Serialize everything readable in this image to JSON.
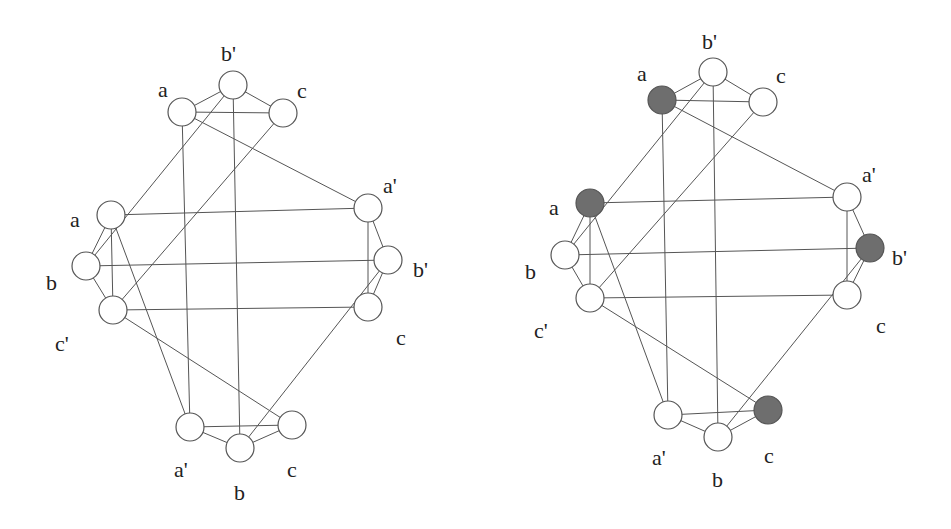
{
  "colors": {
    "background": "#ffffff",
    "edge": "#555555",
    "node_outline": "#555555",
    "node_empty": "#ffffff",
    "node_filled": "#6e6e6e",
    "label": "#222222"
  },
  "node_radius": 14,
  "graphs": [
    {
      "id": "left-graph",
      "nodes": [
        {
          "id": "T_a",
          "label": "a",
          "x": 182,
          "y": 112,
          "filled": false,
          "lx": 158,
          "ly": 92
        },
        {
          "id": "T_b",
          "label": "b'",
          "x": 233,
          "y": 85,
          "filled": false,
          "lx": 221,
          "ly": 56
        },
        {
          "id": "T_c",
          "label": "c",
          "x": 283,
          "y": 113,
          "filled": false,
          "lx": 297,
          "ly": 93
        },
        {
          "id": "L_a",
          "label": "a",
          "x": 111,
          "y": 215,
          "filled": false,
          "lx": 70,
          "ly": 222
        },
        {
          "id": "L_b",
          "label": "b",
          "x": 86,
          "y": 266,
          "filled": false,
          "lx": 46,
          "ly": 285
        },
        {
          "id": "L_c",
          "label": "c'",
          "x": 113,
          "y": 310,
          "filled": false,
          "lx": 55,
          "ly": 346
        },
        {
          "id": "R_a",
          "label": "a'",
          "x": 368,
          "y": 208,
          "filled": false,
          "lx": 383,
          "ly": 188
        },
        {
          "id": "R_b",
          "label": "b'",
          "x": 388,
          "y": 260,
          "filled": false,
          "lx": 413,
          "ly": 272
        },
        {
          "id": "R_c",
          "label": "c",
          "x": 368,
          "y": 307,
          "filled": false,
          "lx": 396,
          "ly": 340
        },
        {
          "id": "B_a",
          "label": "a'",
          "x": 190,
          "y": 427,
          "filled": false,
          "lx": 174,
          "ly": 472
        },
        {
          "id": "B_b",
          "label": "b",
          "x": 240,
          "y": 448,
          "filled": false,
          "lx": 234,
          "ly": 495
        },
        {
          "id": "B_c",
          "label": "c",
          "x": 292,
          "y": 425,
          "filled": false,
          "lx": 287,
          "ly": 472
        }
      ]
    },
    {
      "id": "right-graph",
      "nodes": [
        {
          "id": "T_a",
          "label": "a",
          "x": 662,
          "y": 100,
          "filled": true,
          "lx": 637,
          "ly": 76
        },
        {
          "id": "T_b",
          "label": "b'",
          "x": 713,
          "y": 72,
          "filled": false,
          "lx": 702,
          "ly": 44
        },
        {
          "id": "T_c",
          "label": "c",
          "x": 763,
          "y": 102,
          "filled": false,
          "lx": 776,
          "ly": 78
        },
        {
          "id": "L_a",
          "label": "a",
          "x": 590,
          "y": 203,
          "filled": true,
          "lx": 549,
          "ly": 210
        },
        {
          "id": "L_b",
          "label": "b",
          "x": 565,
          "y": 255,
          "filled": false,
          "lx": 525,
          "ly": 274
        },
        {
          "id": "L_c",
          "label": "c'",
          "x": 590,
          "y": 298,
          "filled": false,
          "lx": 534,
          "ly": 333
        },
        {
          "id": "R_a",
          "label": "a'",
          "x": 847,
          "y": 197,
          "filled": false,
          "lx": 862,
          "ly": 177
        },
        {
          "id": "R_b",
          "label": "b'",
          "x": 870,
          "y": 248,
          "filled": true,
          "lx": 892,
          "ly": 260
        },
        {
          "id": "R_c",
          "label": "c",
          "x": 847,
          "y": 295,
          "filled": false,
          "lx": 876,
          "ly": 328
        },
        {
          "id": "B_a",
          "label": "a'",
          "x": 668,
          "y": 415,
          "filled": false,
          "lx": 652,
          "ly": 460
        },
        {
          "id": "B_b",
          "label": "b",
          "x": 718,
          "y": 437,
          "filled": false,
          "lx": 712,
          "ly": 482
        },
        {
          "id": "B_c",
          "label": "c",
          "x": 768,
          "y": 410,
          "filled": true,
          "lx": 764,
          "ly": 458
        }
      ]
    }
  ],
  "edges": [
    [
      "T_a",
      "T_b"
    ],
    [
      "T_b",
      "T_c"
    ],
    [
      "T_a",
      "T_c"
    ],
    [
      "L_a",
      "L_b"
    ],
    [
      "L_b",
      "L_c"
    ],
    [
      "L_a",
      "L_c"
    ],
    [
      "R_a",
      "R_b"
    ],
    [
      "R_b",
      "R_c"
    ],
    [
      "R_a",
      "R_c"
    ],
    [
      "B_a",
      "B_b"
    ],
    [
      "B_b",
      "B_c"
    ],
    [
      "B_a",
      "B_c"
    ],
    [
      "T_a",
      "R_a"
    ],
    [
      "T_a",
      "B_a"
    ],
    [
      "T_b",
      "L_b"
    ],
    [
      "T_b",
      "B_b"
    ],
    [
      "T_c",
      "L_c"
    ],
    [
      "L_a",
      "R_a"
    ],
    [
      "L_a",
      "B_a"
    ],
    [
      "L_b",
      "R_b"
    ],
    [
      "L_c",
      "R_c"
    ],
    [
      "L_c",
      "B_c"
    ],
    [
      "R_b",
      "B_b"
    ]
  ]
}
